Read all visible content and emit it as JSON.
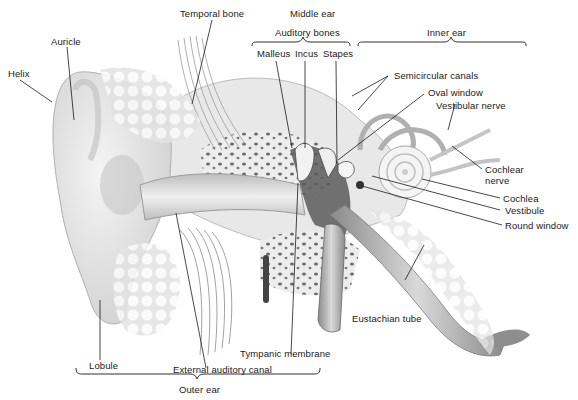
{
  "diagram": {
    "region_labels": {
      "outer_ear": "Outer ear",
      "middle_ear": "Middle ear",
      "inner_ear": "Inner ear",
      "auditory_bones": "Auditory bones"
    },
    "labels": {
      "helix": "Helix",
      "auricle": "Auricle",
      "temporal_bone": "Temporal bone",
      "malleus": "Malleus",
      "incus": "Incus",
      "stapes": "Stapes",
      "semicircular_canals": "Semicircular canals",
      "oval_window": "Oval window",
      "vestibular_nerve": "Vestibular nerve",
      "cochlear_nerve_1": "Cochlear",
      "cochlear_nerve_2": "nerve",
      "cochlea": "Cochlea",
      "vestibule": "Vestibule",
      "round_window": "Round window",
      "eustachian_tube": "Eustachian tube",
      "tympanic_membrane": "Tympanic membrane",
      "external_auditory_canal": "External auditory canal",
      "lobule": "Lobule"
    },
    "colors": {
      "line": "#1a1a1a",
      "bone_light": "#e6e6e6",
      "bone_dark": "#555555",
      "tissue": "#d8d8d8"
    }
  }
}
